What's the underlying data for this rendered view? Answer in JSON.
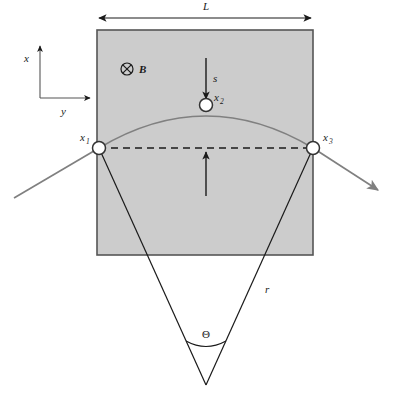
{
  "figure": {
    "type": "physics-diagram",
    "labels": {
      "width_dimension": "L",
      "field_symbol_name": "b-field-into-page",
      "field_label": "B",
      "axis_vertical": "x",
      "axis_horizontal": "y",
      "sagitta": "s",
      "radius": "r",
      "angle": "Θ",
      "point_1_base": "x",
      "point_1_sub": "1",
      "point_2_base": "x",
      "point_2_sub": "2",
      "point_3_base": "x",
      "point_3_sub": "3"
    },
    "colors": {
      "field_region_fill": "#cccccc",
      "field_region_stroke": "#555555",
      "trajectory": "#808080",
      "construction_line": "#1a1a1a",
      "dashed_chord": "#1a1a1a",
      "marker_fill": "#ffffff",
      "marker_stroke": "#333333",
      "text": "#1a1a1a",
      "background": "#ffffff"
    },
    "geometry": {
      "box_left": 97,
      "box_top": 30,
      "box_right": 313,
      "box_bottom": 255,
      "point_1_x": 99,
      "point_1_y": 148,
      "point_2_x": 206,
      "point_2_y": 105,
      "point_3_x": 313,
      "point_3_y": 148,
      "vertex_x": 206,
      "vertex_y": 385,
      "marker_radius": 6.5,
      "dim_arrow_y": 18
    }
  }
}
